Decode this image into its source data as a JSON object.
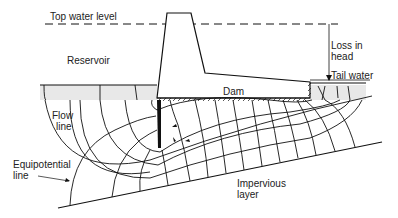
{
  "diagram": {
    "type": "flow net beneath a gravity dam",
    "labels": {
      "top_water_level": "Top water level",
      "reservoir": "Reservoir",
      "loss_in_head_1": "Loss in",
      "loss_in_head_2": "head",
      "tail_water": "Tail water",
      "dam": "Dam",
      "flow_line_1": "Flow",
      "flow_line_2": "line",
      "equipotential_1": "Equipotential",
      "equipotential_2": "line",
      "impervious_1": "Impervious",
      "impervious_2": "layer"
    },
    "colors": {
      "line": "#111111",
      "ground_fill": "#e6e6e6"
    }
  }
}
